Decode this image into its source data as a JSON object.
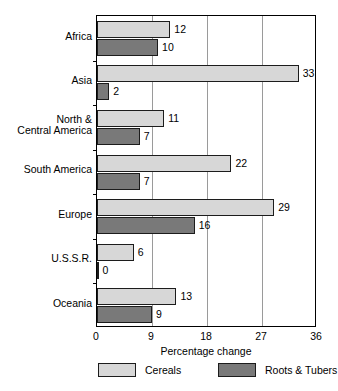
{
  "chart_data": {
    "type": "bar",
    "orientation": "horizontal",
    "title": "",
    "xlabel": "Percentage change",
    "ylabel": "",
    "xlim": [
      0,
      36
    ],
    "xticks": [
      0,
      9,
      18,
      27,
      36
    ],
    "xtick_labels": [
      "0",
      "9",
      "18",
      "27",
      "36"
    ],
    "grid": "vertical gridlines at 9, 18, 27",
    "legend_position": "bottom",
    "categories": [
      "Africa",
      "Asia",
      "North &\nCentral America",
      "South America",
      "Europe",
      "U.S.S.R.",
      "Oceania"
    ],
    "series": [
      {
        "name": "Cereals",
        "color": "#d7d7d7",
        "values": [
          12,
          33,
          11,
          22,
          29,
          6,
          13
        ],
        "value_labels": [
          "12",
          "33",
          "11",
          "22",
          "29",
          "6",
          "13"
        ]
      },
      {
        "name": "Roots & Tubers",
        "color": "#797979",
        "values": [
          10,
          2,
          7,
          7,
          16,
          0,
          9
        ],
        "value_labels": [
          "10",
          "2",
          "7",
          "7",
          "16",
          "0",
          "9"
        ]
      }
    ]
  },
  "colors": {
    "cereals": "#d7d7d7",
    "roots_tubers": "#797979",
    "axis": "#000000",
    "gridline": "#9a9a9a",
    "background": "#ffffff"
  }
}
